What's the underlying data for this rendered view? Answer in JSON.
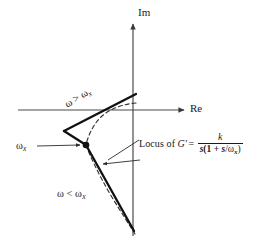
{
  "figure": {
    "axes": {
      "imaginary_label": "Im",
      "real_label": "Re"
    },
    "annotations": {
      "omega_greater": "ω > ω",
      "omega_greater_sub": "x",
      "omega_less": "ω < ω",
      "omega_less_sub": "x",
      "omega_x": "ω",
      "omega_x_sub": "x",
      "locus_lead": "Locus of",
      "locus_gname": "G′",
      "locus_equals": "=",
      "numerator": "k",
      "denominator_pre": "s",
      "denominator_open": "(1 + ",
      "denominator_s": "s",
      "denominator_slash": "/",
      "denominator_omega": "ω",
      "denominator_sub": "x",
      "denominator_close": ")"
    },
    "colors": {
      "ink": "#1a1a1a",
      "axis": "#4a4a4a",
      "background": "#ffffff",
      "asymptote": "#111111",
      "locus_dash": "#333333"
    },
    "geometry": {
      "origin": {
        "x": 133,
        "y": 110
      },
      "im_axis": {
        "x": 133,
        "y_top": 22,
        "y_bottom": 236
      },
      "re_axis": {
        "x_left": 18,
        "x_right": 186,
        "y": 110
      },
      "breakpoint_marker": {
        "x": 86,
        "y": 145,
        "radius": 3.2
      },
      "upper_asymptote_end": {
        "x": 136,
        "y": 95
      },
      "lower_asymptote_end": {
        "x": 134,
        "y": 231
      }
    }
  }
}
